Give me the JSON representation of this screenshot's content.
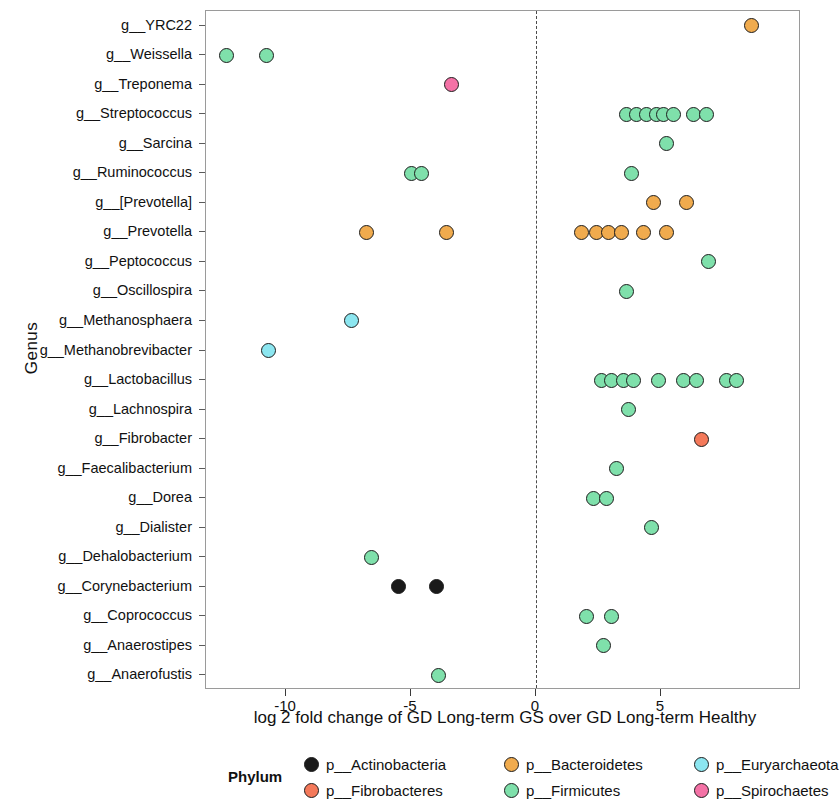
{
  "chart_data": {
    "type": "scatter",
    "title": "",
    "xlabel": "log 2 fold change of GD Long-term GS over GD Long-term Healthy",
    "ylabel": "Genus",
    "xlim": [
      -13.2,
      10.6
    ],
    "xticks": [
      -10,
      -5,
      0,
      5
    ],
    "xticklabels": [
      "-10",
      "-5",
      "0",
      "5"
    ],
    "grid": false,
    "zero_reference_line": 0,
    "legend_position": "bottom",
    "legend_title": "Phylum",
    "categories": [
      "g__YRC22",
      "g__Weissella",
      "g__Treponema",
      "g__Streptococcus",
      "g__Sarcina",
      "g__Ruminococcus",
      "g__[Prevotella]",
      "g__Prevotella",
      "g__Peptococcus",
      "g__Oscillospira",
      "g__Methanosphaera",
      "g__Methanobrevibacter",
      "g__Lactobacillus",
      "g__Lachnospira",
      "g__Fibrobacter",
      "g__Faecalibacterium",
      "g__Dorea",
      "g__Dialister",
      "g__Dehalobacterium",
      "g__Corynebacterium",
      "g__Coprococcus",
      "g__Anaerostipes",
      "g__Anaerofustis"
    ],
    "phyla": [
      {
        "name": "p__Actinobacteria",
        "color": "#1a1a1a"
      },
      {
        "name": "p__Bacteroidetes",
        "color": "#f0ab4e"
      },
      {
        "name": "p__Euryarchaeota",
        "color": "#8ce6f0"
      },
      {
        "name": "p__Fibrobacteres",
        "color": "#f4795a"
      },
      {
        "name": "p__Firmicutes",
        "color": "#7fe0ab"
      },
      {
        "name": "p__Spirochaetes",
        "color": "#f472a6"
      }
    ],
    "points": [
      {
        "genus": "g__YRC22",
        "phylum": "p__Bacteroidetes",
        "x": 8.6
      },
      {
        "genus": "g__Weissella",
        "phylum": "p__Firmicutes",
        "x": -12.4
      },
      {
        "genus": "g__Weissella",
        "phylum": "p__Firmicutes",
        "x": -10.8
      },
      {
        "genus": "g__Treponema",
        "phylum": "p__Spirochaetes",
        "x": -3.4
      },
      {
        "genus": "g__Streptococcus",
        "phylum": "p__Firmicutes",
        "x": 3.6
      },
      {
        "genus": "g__Streptococcus",
        "phylum": "p__Firmicutes",
        "x": 4.0
      },
      {
        "genus": "g__Streptococcus",
        "phylum": "p__Firmicutes",
        "x": 4.4
      },
      {
        "genus": "g__Streptococcus",
        "phylum": "p__Firmicutes",
        "x": 4.8
      },
      {
        "genus": "g__Streptococcus",
        "phylum": "p__Firmicutes",
        "x": 5.1
      },
      {
        "genus": "g__Streptococcus",
        "phylum": "p__Firmicutes",
        "x": 5.5
      },
      {
        "genus": "g__Streptococcus",
        "phylum": "p__Firmicutes",
        "x": 6.3
      },
      {
        "genus": "g__Streptococcus",
        "phylum": "p__Firmicutes",
        "x": 6.8
      },
      {
        "genus": "g__Sarcina",
        "phylum": "p__Firmicutes",
        "x": 5.2
      },
      {
        "genus": "g__Ruminococcus",
        "phylum": "p__Firmicutes",
        "x": -5.0
      },
      {
        "genus": "g__Ruminococcus",
        "phylum": "p__Firmicutes",
        "x": -4.6
      },
      {
        "genus": "g__Ruminococcus",
        "phylum": "p__Firmicutes",
        "x": 3.8
      },
      {
        "genus": "g__[Prevotella]",
        "phylum": "p__Bacteroidetes",
        "x": 4.7
      },
      {
        "genus": "g__[Prevotella]",
        "phylum": "p__Bacteroidetes",
        "x": 6.0
      },
      {
        "genus": "g__Prevotella",
        "phylum": "p__Bacteroidetes",
        "x": -6.8
      },
      {
        "genus": "g__Prevotella",
        "phylum": "p__Bacteroidetes",
        "x": -3.6
      },
      {
        "genus": "g__Prevotella",
        "phylum": "p__Bacteroidetes",
        "x": 1.8
      },
      {
        "genus": "g__Prevotella",
        "phylum": "p__Bacteroidetes",
        "x": 2.4
      },
      {
        "genus": "g__Prevotella",
        "phylum": "p__Bacteroidetes",
        "x": 2.9
      },
      {
        "genus": "g__Prevotella",
        "phylum": "p__Bacteroidetes",
        "x": 3.4
      },
      {
        "genus": "g__Prevotella",
        "phylum": "p__Bacteroidetes",
        "x": 4.3
      },
      {
        "genus": "g__Prevotella",
        "phylum": "p__Bacteroidetes",
        "x": 5.2
      },
      {
        "genus": "g__Peptococcus",
        "phylum": "p__Firmicutes",
        "x": 6.9
      },
      {
        "genus": "g__Oscillospira",
        "phylum": "p__Firmicutes",
        "x": 3.6
      },
      {
        "genus": "g__Methanosphaera",
        "phylum": "p__Euryarchaeota",
        "x": -7.4
      },
      {
        "genus": "g__Methanobrevibacter",
        "phylum": "p__Euryarchaeota",
        "x": -10.7
      },
      {
        "genus": "g__Lactobacillus",
        "phylum": "p__Firmicutes",
        "x": 2.6
      },
      {
        "genus": "g__Lactobacillus",
        "phylum": "p__Firmicutes",
        "x": 3.0
      },
      {
        "genus": "g__Lactobacillus",
        "phylum": "p__Firmicutes",
        "x": 3.5
      },
      {
        "genus": "g__Lactobacillus",
        "phylum": "p__Firmicutes",
        "x": 3.9
      },
      {
        "genus": "g__Lactobacillus",
        "phylum": "p__Firmicutes",
        "x": 4.9
      },
      {
        "genus": "g__Lactobacillus",
        "phylum": "p__Firmicutes",
        "x": 5.9
      },
      {
        "genus": "g__Lactobacillus",
        "phylum": "p__Firmicutes",
        "x": 6.4
      },
      {
        "genus": "g__Lactobacillus",
        "phylum": "p__Firmicutes",
        "x": 7.6
      },
      {
        "genus": "g__Lactobacillus",
        "phylum": "p__Firmicutes",
        "x": 8.0
      },
      {
        "genus": "g__Lachnospira",
        "phylum": "p__Firmicutes",
        "x": 3.7
      },
      {
        "genus": "g__Fibrobacter",
        "phylum": "p__Fibrobacteres",
        "x": 6.6
      },
      {
        "genus": "g__Faecalibacterium",
        "phylum": "p__Firmicutes",
        "x": 3.2
      },
      {
        "genus": "g__Dorea",
        "phylum": "p__Firmicutes",
        "x": 2.3
      },
      {
        "genus": "g__Dorea",
        "phylum": "p__Firmicutes",
        "x": 2.8
      },
      {
        "genus": "g__Dialister",
        "phylum": "p__Firmicutes",
        "x": 4.6
      },
      {
        "genus": "g__Dehalobacterium",
        "phylum": "p__Firmicutes",
        "x": -6.6
      },
      {
        "genus": "g__Corynebacterium",
        "phylum": "p__Actinobacteria",
        "x": -5.5
      },
      {
        "genus": "g__Corynebacterium",
        "phylum": "p__Actinobacteria",
        "x": -4.0
      },
      {
        "genus": "g__Coprococcus",
        "phylum": "p__Firmicutes",
        "x": 2.0
      },
      {
        "genus": "g__Coprococcus",
        "phylum": "p__Firmicutes",
        "x": 3.0
      },
      {
        "genus": "g__Anaerostipes",
        "phylum": "p__Firmicutes",
        "x": 2.7
      },
      {
        "genus": "g__Anaerofustis",
        "phylum": "p__Firmicutes",
        "x": -3.9
      }
    ]
  },
  "legend": {
    "title": "Phylum",
    "rows": [
      [
        "p__Actinobacteria",
        "p__Bacteroidetes",
        "p__Euryarchaeota"
      ],
      [
        "p__Fibrobacteres",
        "p__Firmicutes",
        "p__Spirochaetes"
      ]
    ]
  }
}
